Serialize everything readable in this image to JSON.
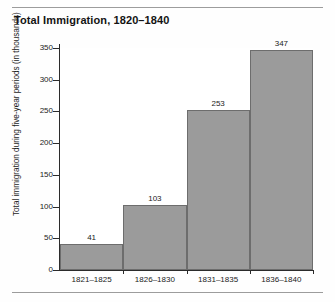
{
  "figure": {
    "title": "Total Immigration, 1820–1840",
    "has_top_rule": true,
    "has_bottom_rule": true
  },
  "chart_data": {
    "type": "bar",
    "title": "Total Immigration, 1820–1840",
    "xlabel": "",
    "ylabel": "Total immigration during five-year periods (in thousands)",
    "categories": [
      "1821–1825",
      "1826–1830",
      "1831–1835",
      "1836–1840"
    ],
    "values": [
      41,
      103,
      253,
      347
    ],
    "value_labels": [
      "41",
      "103",
      "253",
      "347"
    ],
    "ylim": [
      0,
      350
    ],
    "yticks": [
      0,
      50,
      100,
      150,
      200,
      250,
      300,
      350
    ],
    "ytick_labels": [
      "0",
      "50",
      "100",
      "150",
      "200",
      "250",
      "300",
      "350"
    ],
    "grid": false,
    "legend": null,
    "bar_color": "#9b9b9b",
    "bar_edge_color": "#6d6d6d",
    "axis_color": "#2b2b2b",
    "background": "#ffffff"
  }
}
